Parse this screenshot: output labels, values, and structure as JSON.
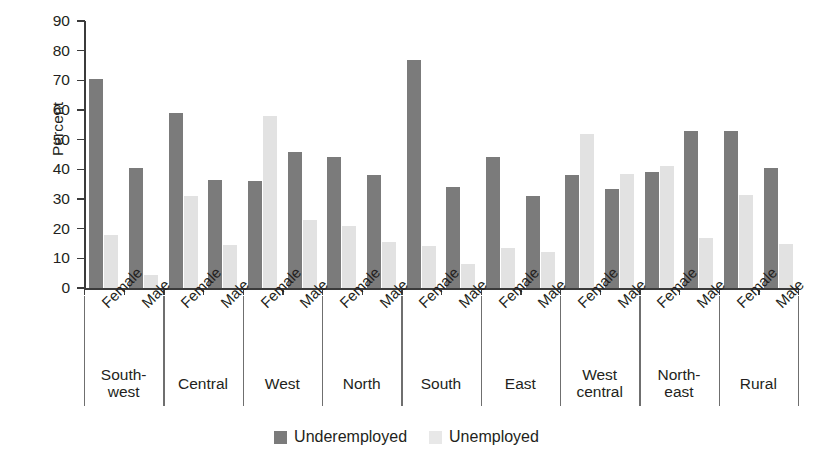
{
  "chart_data": {
    "type": "bar",
    "title": "",
    "xlabel": "",
    "ylabel": "Percent",
    "ylim": [
      0,
      90
    ],
    "yticks": [
      0,
      10,
      20,
      30,
      40,
      50,
      60,
      70,
      80,
      90
    ],
    "grid": false,
    "legend_position": "bottom",
    "groups": [
      "South-\nwest",
      "Central",
      "West",
      "North",
      "South",
      "East",
      "West\ncentral",
      "North-\neast",
      "Rural"
    ],
    "group_labels": [
      {
        "line1": "South-",
        "line2": "west"
      },
      {
        "line1": "Central",
        "line2": ""
      },
      {
        "line1": "West",
        "line2": ""
      },
      {
        "line1": "North",
        "line2": ""
      },
      {
        "line1": "South",
        "line2": ""
      },
      {
        "line1": "East",
        "line2": ""
      },
      {
        "line1": "West",
        "line2": "central"
      },
      {
        "line1": "North-",
        "line2": "east"
      },
      {
        "line1": "Rural",
        "line2": ""
      }
    ],
    "categories": [
      "Female",
      "Male",
      "Female",
      "Male",
      "Female",
      "Male",
      "Female",
      "Male",
      "Female",
      "Male",
      "Female",
      "Male",
      "Female",
      "Male",
      "Female",
      "Male",
      "Female",
      "Male"
    ],
    "series": [
      {
        "name": "Underemployed",
        "color": "#7b7b7b",
        "values": [
          70.5,
          40.5,
          59,
          36.5,
          36,
          46,
          44,
          38,
          77,
          34,
          44,
          31,
          38,
          33.5,
          39,
          53,
          53,
          40.5
        ]
      },
      {
        "name": "Unemployed",
        "color": "#e2e2e2",
        "values": [
          18,
          4.5,
          31,
          14.5,
          58,
          23,
          21,
          15.5,
          14,
          8,
          13.5,
          12,
          52,
          38.5,
          41,
          17,
          31.5,
          15
        ]
      }
    ],
    "data_by_group": [
      {
        "group": "South-west",
        "Female": {
          "Underemployed": 70.5,
          "Unemployed": 18
        },
        "Male": {
          "Underemployed": 40.5,
          "Unemployed": 4.5
        }
      },
      {
        "group": "Central",
        "Female": {
          "Underemployed": 59,
          "Unemployed": 31
        },
        "Male": {
          "Underemployed": 36.5,
          "Unemployed": 14.5
        }
      },
      {
        "group": "West",
        "Female": {
          "Underemployed": 36,
          "Unemployed": 58
        },
        "Male": {
          "Underemployed": 46,
          "Unemployed": 23
        }
      },
      {
        "group": "North",
        "Female": {
          "Underemployed": 44,
          "Unemployed": 21
        },
        "Male": {
          "Underemployed": 38,
          "Unemployed": 15.5
        }
      },
      {
        "group": "South",
        "Female": {
          "Underemployed": 77,
          "Unemployed": 14
        },
        "Male": {
          "Underemployed": 34,
          "Unemployed": 8
        }
      },
      {
        "group": "East",
        "Female": {
          "Underemployed": 44,
          "Unemployed": 13.5
        },
        "Male": {
          "Underemployed": 31,
          "Unemployed": 12
        }
      },
      {
        "group": "West central",
        "Female": {
          "Underemployed": 38,
          "Unemployed": 52
        },
        "Male": {
          "Underemployed": 33.5,
          "Unemployed": 38.5
        }
      },
      {
        "group": "North-east",
        "Female": {
          "Underemployed": 39,
          "Unemployed": 41
        },
        "Male": {
          "Underemployed": 53,
          "Unemployed": 17
        }
      },
      {
        "group": "Rural",
        "Female": {
          "Underemployed": 53,
          "Unemployed": 31.5
        },
        "Male": {
          "Underemployed": 40.5,
          "Unemployed": 15
        }
      }
    ],
    "legend": [
      {
        "label": "Underemployed",
        "color": "#7b7b7b"
      },
      {
        "label": "Unemployed",
        "color": "#e8e8e8"
      }
    ]
  }
}
